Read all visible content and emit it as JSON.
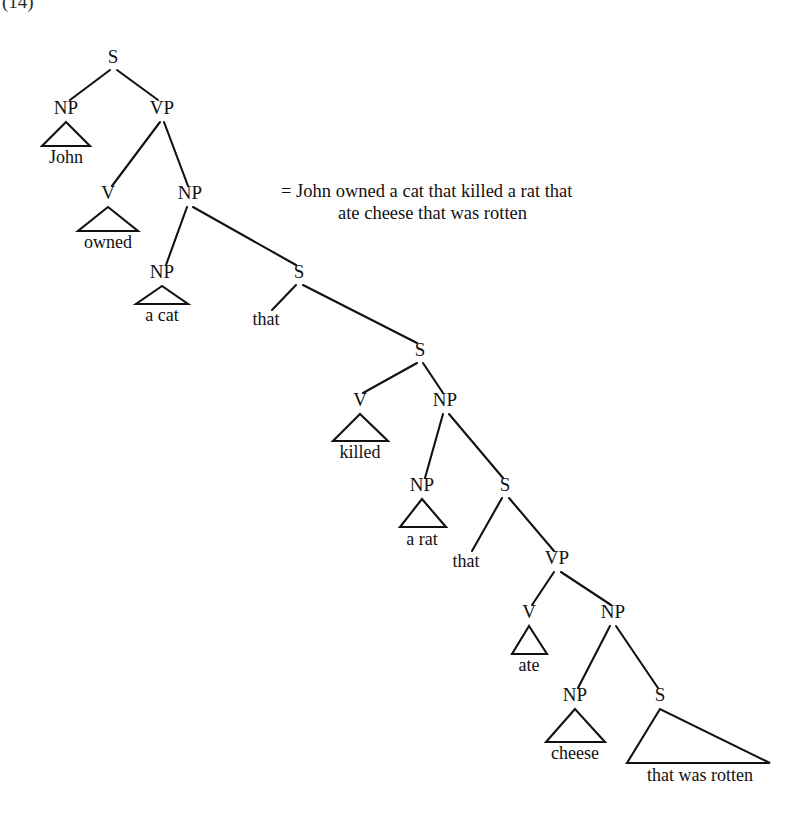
{
  "figure": {
    "kind": "syntax-tree",
    "example_number": "(14)",
    "background_color": "#ffffff",
    "ink_color": "#111111"
  },
  "gloss": {
    "equals_sign": "=",
    "line1": "= John owned a cat that killed a rat that",
    "line2": "ate cheese that was rotten",
    "full_sentence": "John owned a cat that killed a rat that ate cheese that was rotten"
  },
  "tree": {
    "nodes": [
      {
        "id": "S1",
        "label": "S",
        "x": 113,
        "y": 63
      },
      {
        "id": "NP1",
        "label": "NP",
        "x": 66,
        "y": 114
      },
      {
        "id": "VP1",
        "label": "VP",
        "x": 162,
        "y": 114
      },
      {
        "id": "V1",
        "label": "V",
        "x": 108,
        "y": 199
      },
      {
        "id": "NP2",
        "label": "NP",
        "x": 190,
        "y": 199
      },
      {
        "id": "NP3",
        "label": "NP",
        "x": 162,
        "y": 278
      },
      {
        "id": "S2",
        "label": "S",
        "x": 299,
        "y": 278
      },
      {
        "id": "S3",
        "label": "S",
        "x": 420,
        "y": 356
      },
      {
        "id": "V2",
        "label": "V",
        "x": 360,
        "y": 406
      },
      {
        "id": "NP4",
        "label": "NP",
        "x": 445,
        "y": 406
      },
      {
        "id": "NP5",
        "label": "NP",
        "x": 422,
        "y": 491
      },
      {
        "id": "S4",
        "label": "S",
        "x": 505,
        "y": 491
      },
      {
        "id": "VP2",
        "label": "VP",
        "x": 557,
        "y": 564
      },
      {
        "id": "V3",
        "label": "V",
        "x": 529,
        "y": 618
      },
      {
        "id": "NP6",
        "label": "NP",
        "x": 613,
        "y": 618
      },
      {
        "id": "NP7",
        "label": "NP",
        "x": 575,
        "y": 701
      },
      {
        "id": "S5",
        "label": "S",
        "x": 660,
        "y": 701
      }
    ],
    "edges": [
      {
        "from": "S1",
        "to": "NP1",
        "x1": 110,
        "y1": 70,
        "x2": 70,
        "y2": 100
      },
      {
        "from": "S1",
        "to": "VP1",
        "x1": 117,
        "y1": 70,
        "x2": 158,
        "y2": 100
      },
      {
        "from": "VP1",
        "to": "V1",
        "x1": 160,
        "y1": 122,
        "x2": 112,
        "y2": 186
      },
      {
        "from": "VP1",
        "to": "NP2",
        "x1": 164,
        "y1": 122,
        "x2": 188,
        "y2": 186
      },
      {
        "from": "NP2",
        "to": "NP3",
        "x1": 187,
        "y1": 207,
        "x2": 166,
        "y2": 265
      },
      {
        "from": "NP2",
        "to": "S2",
        "x1": 193,
        "y1": 207,
        "x2": 296,
        "y2": 265
      },
      {
        "from": "S2",
        "to": "that1",
        "x1": 296,
        "y1": 285,
        "x2": 272,
        "y2": 310
      },
      {
        "from": "S2",
        "to": "S3",
        "x1": 303,
        "y1": 285,
        "x2": 417,
        "y2": 343
      },
      {
        "from": "S3",
        "to": "V2",
        "x1": 417,
        "y1": 363,
        "x2": 363,
        "y2": 393
      },
      {
        "from": "S3",
        "to": "NP4",
        "x1": 423,
        "y1": 363,
        "x2": 443,
        "y2": 393
      },
      {
        "from": "NP4",
        "to": "NP5",
        "x1": 443,
        "y1": 414,
        "x2": 425,
        "y2": 478
      },
      {
        "from": "NP4",
        "to": "S4",
        "x1": 449,
        "y1": 414,
        "x2": 503,
        "y2": 478
      },
      {
        "from": "S4",
        "to": "that2",
        "x1": 502,
        "y1": 498,
        "x2": 472,
        "y2": 551
      },
      {
        "from": "S4",
        "to": "VP2",
        "x1": 509,
        "y1": 498,
        "x2": 554,
        "y2": 551
      },
      {
        "from": "VP2",
        "to": "V3",
        "x1": 554,
        "y1": 572,
        "x2": 532,
        "y2": 605
      },
      {
        "from": "VP2",
        "to": "NP6",
        "x1": 561,
        "y1": 572,
        "x2": 611,
        "y2": 605
      },
      {
        "from": "NP6",
        "to": "NP7",
        "x1": 610,
        "y1": 626,
        "x2": 578,
        "y2": 688
      },
      {
        "from": "NP6",
        "to": "S5",
        "x1": 616,
        "y1": 626,
        "x2": 658,
        "y2": 688
      }
    ],
    "triangles": [
      {
        "id": "tri-john",
        "parent": "NP1",
        "text": "John",
        "apex_x": 66,
        "apex_y": 122,
        "left_x": 42,
        "right_x": 90,
        "base_y": 146,
        "text_x": 66,
        "text_y": 163
      },
      {
        "id": "tri-owned",
        "parent": "V1",
        "text": "owned",
        "apex_x": 108,
        "apex_y": 207,
        "left_x": 78,
        "right_x": 138,
        "base_y": 231,
        "text_x": 108,
        "text_y": 248
      },
      {
        "id": "tri-acat",
        "parent": "NP3",
        "text": "a cat",
        "apex_x": 162,
        "apex_y": 286,
        "left_x": 136,
        "right_x": 188,
        "base_y": 304,
        "text_x": 162,
        "text_y": 321
      },
      {
        "id": "tri-killed",
        "parent": "V2",
        "text": "killed",
        "apex_x": 360,
        "apex_y": 414,
        "left_x": 333,
        "right_x": 388,
        "base_y": 441,
        "text_x": 360,
        "text_y": 458
      },
      {
        "id": "tri-arat",
        "parent": "NP5",
        "text": "a rat",
        "apex_x": 422,
        "apex_y": 499,
        "left_x": 400,
        "right_x": 446,
        "base_y": 527,
        "text_x": 422,
        "text_y": 545
      },
      {
        "id": "tri-ate",
        "parent": "V3",
        "text": "ate",
        "apex_x": 529,
        "apex_y": 626,
        "left_x": 512,
        "right_x": 547,
        "base_y": 654,
        "text_x": 529,
        "text_y": 671
      },
      {
        "id": "tri-cheese",
        "parent": "NP7",
        "text": "cheese",
        "apex_x": 575,
        "apex_y": 709,
        "left_x": 546,
        "right_x": 605,
        "base_y": 742,
        "text_x": 575,
        "text_y": 759
      },
      {
        "id": "tri-rotten",
        "parent": "S5",
        "text": "that was rotten",
        "apex_x": 660,
        "apex_y": 709,
        "left_x": 627,
        "right_x": 770,
        "base_y": 763,
        "text_x": 700,
        "text_y": 781
      }
    ],
    "plain_terminals": [
      {
        "id": "that1",
        "text": "that",
        "x": 266,
        "y": 325
      },
      {
        "id": "that2",
        "text": "that",
        "x": 466,
        "y": 567
      }
    ]
  }
}
